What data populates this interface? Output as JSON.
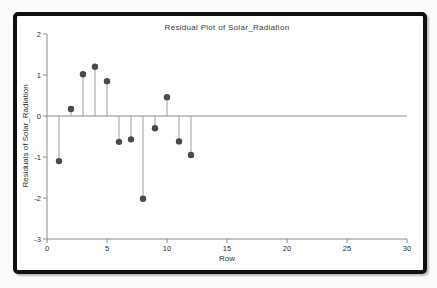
{
  "frame": {
    "border_color": "#101010",
    "background": "#ffffff"
  },
  "chart_data": {
    "type": "stem",
    "title": "Residual Plot of Solar_Radiation",
    "xlabel": "Row",
    "ylabel": "Residuals of Solar_Radiation",
    "x": [
      1,
      2,
      3,
      4,
      5,
      6,
      7,
      8,
      9,
      10,
      11,
      12
    ],
    "values": [
      -1.1,
      0.17,
      1.02,
      1.2,
      0.85,
      -0.63,
      -0.57,
      -2.02,
      -0.3,
      0.46,
      -0.62,
      -0.95
    ],
    "baseline": 0,
    "xlim": [
      0,
      30
    ],
    "ylim": [
      -3,
      2
    ],
    "xticks": [
      0,
      5,
      10,
      15,
      20,
      25,
      30
    ],
    "yticks": [
      2,
      1,
      0,
      -1,
      -2,
      -3
    ],
    "grid": false,
    "legend": null,
    "colors": {
      "point": "#4a4a4a",
      "stem": "#9f9f9f",
      "axis": "#8a8a8a",
      "tick_text": "#2b2b2b",
      "title_text": "#3a3a3a"
    }
  }
}
